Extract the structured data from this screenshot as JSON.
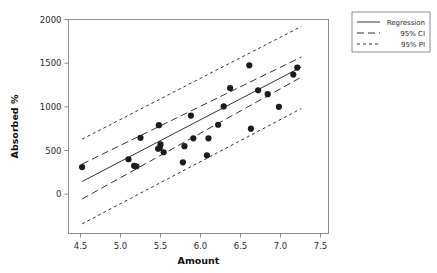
{
  "chart_data": {
    "type": "scatter",
    "title": "",
    "xlabel": "Amount",
    "ylabel": "Absorbed %",
    "xlim": [
      4.35,
      7.6
    ],
    "ylim": [
      -450,
      2000
    ],
    "grid": false,
    "x_ticks": [
      "4.5",
      "5.0",
      "5.5",
      "6.0",
      "6.5",
      "7.0",
      "7.5"
    ],
    "x_tick_values": [
      4.5,
      5.0,
      5.5,
      6.0,
      6.5,
      7.0,
      7.5
    ],
    "y_ticks": [
      "0",
      "500",
      "1000",
      "1500",
      "2000"
    ],
    "y_tick_values": [
      0,
      500,
      1000,
      1500,
      2000
    ],
    "points": [
      {
        "x": 4.52,
        "y": 310
      },
      {
        "x": 5.1,
        "y": 400
      },
      {
        "x": 5.17,
        "y": 325
      },
      {
        "x": 5.2,
        "y": 320
      },
      {
        "x": 5.25,
        "y": 645
      },
      {
        "x": 5.47,
        "y": 520
      },
      {
        "x": 5.49,
        "y": 530
      },
      {
        "x": 5.5,
        "y": 570
      },
      {
        "x": 5.48,
        "y": 790
      },
      {
        "x": 5.54,
        "y": 480
      },
      {
        "x": 5.78,
        "y": 365
      },
      {
        "x": 5.8,
        "y": 550
      },
      {
        "x": 5.88,
        "y": 900
      },
      {
        "x": 5.91,
        "y": 640
      },
      {
        "x": 6.08,
        "y": 445
      },
      {
        "x": 6.1,
        "y": 640
      },
      {
        "x": 6.22,
        "y": 795
      },
      {
        "x": 6.29,
        "y": 1005
      },
      {
        "x": 6.37,
        "y": 1215
      },
      {
        "x": 6.61,
        "y": 1475
      },
      {
        "x": 6.63,
        "y": 750
      },
      {
        "x": 6.72,
        "y": 1190
      },
      {
        "x": 6.84,
        "y": 1145
      },
      {
        "x": 6.98,
        "y": 1000
      },
      {
        "x": 7.16,
        "y": 1370
      },
      {
        "x": 7.21,
        "y": 1450
      }
    ],
    "series": [
      {
        "name": "Regression",
        "style": "solid",
        "x": [
          4.52,
          7.26
        ],
        "y": [
          145,
          1455
        ]
      },
      {
        "name": "95% CI upper",
        "style": "dashed",
        "x": [
          4.52,
          7.26
        ],
        "y": [
          345,
          1570
        ]
      },
      {
        "name": "95% CI lower",
        "style": "dashed",
        "x": [
          4.52,
          7.26
        ],
        "y": [
          -55,
          1340
        ]
      },
      {
        "name": "95% PI upper",
        "style": "dashdot",
        "x": [
          4.52,
          7.26
        ],
        "y": [
          630,
          1920
        ]
      },
      {
        "name": "95% PI lower",
        "style": "dashdot",
        "x": [
          4.52,
          7.26
        ],
        "y": [
          -340,
          980
        ]
      }
    ],
    "legend": {
      "position": "right-top",
      "entries": [
        {
          "label": "Regression",
          "style": "solid"
        },
        {
          "label": "95% CI",
          "style": "dashed"
        },
        {
          "label": "95% PI",
          "style": "dashdot"
        }
      ]
    }
  }
}
